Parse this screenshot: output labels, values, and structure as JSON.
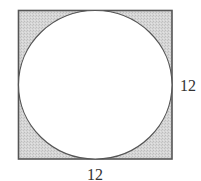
{
  "diagram": {
    "square": {
      "side_label_right": "12",
      "side_label_bottom": "12",
      "fill_color": "#d2d2d2",
      "stroke_color": "#555555"
    },
    "circle": {
      "fill_color": "#ffffff",
      "stroke_color": "#555555"
    }
  }
}
